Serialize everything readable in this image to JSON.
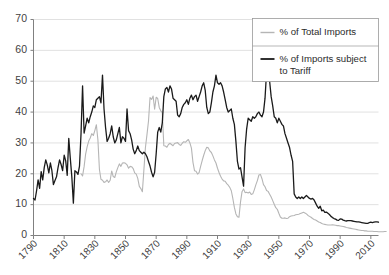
{
  "chart_data": {
    "type": "line",
    "title": "",
    "subtitle": "",
    "xlabel": "",
    "ylabel": "",
    "xlim": [
      1790,
      2015
    ],
    "ylim": [
      0,
      70
    ],
    "yticks": [
      0,
      10,
      20,
      30,
      40,
      50,
      60,
      70
    ],
    "ytick_labels": [
      "0",
      "10",
      "20",
      "30",
      "40",
      "50",
      "60",
      "70"
    ],
    "xticks": [
      1790,
      1810,
      1830,
      1850,
      1870,
      1890,
      1910,
      1930,
      1950,
      1970,
      1990,
      2010
    ],
    "xtick_labels": [
      "1790",
      "1810",
      "1830",
      "1850",
      "1870",
      "1890",
      "1910",
      "1930",
      "1950",
      "1970",
      "1990",
      "2010"
    ],
    "xtick_rotation": 45,
    "grid": "horizontal",
    "grid_color": "#d9d9d9",
    "legend_position": "top-right",
    "legend_border_color": "#999999",
    "axis_color": "#808080",
    "series": [
      {
        "name": "% of Total Imports",
        "color": "#b5b5b5",
        "line_width": 1.1,
        "x_start": 1821,
        "values": [
          20.0,
          19.3,
          22.3,
          26.4,
          28.8,
          30.6,
          31.6,
          33.0,
          32.4,
          34.0,
          35.9,
          31.0,
          21.4,
          18.2,
          17.9,
          17.2,
          17.4,
          18.0,
          17.2,
          17.9,
          20.9,
          19.1,
          18.8,
          20.6,
          22.0,
          23.2,
          22.4,
          23.5,
          23.6,
          23.4,
          22.9,
          21.8,
          22.4,
          22.3,
          21.7,
          20.3,
          19.9,
          18.5,
          15.9,
          15.2,
          14.2,
          21.3,
          28.5,
          32.7,
          37.1,
          44.7,
          44.1,
          45.2,
          40.9,
          44.8,
          44.4,
          41.5,
          40.4,
          39.8,
          29.1,
          29.0,
          28.6,
          29.5,
          29.9,
          29.5,
          29.1,
          29.8,
          30.0,
          30.1,
          29.5,
          29.2,
          29.9,
          30.4,
          30.2,
          30.7,
          31.1,
          30.0,
          28.3,
          23.7,
          21.0,
          20.8,
          19.9,
          20.4,
          22.4,
          24.3,
          26.0,
          27.5,
          28.6,
          28.4,
          27.4,
          26.9,
          25.8,
          24.5,
          23.5,
          21.8,
          20.4,
          19.2,
          18.3,
          17.7,
          17.6,
          16.8,
          16.3,
          15.6,
          14.5,
          12.0,
          9.1,
          7.0,
          6.1,
          5.9,
          10.8,
          14.2,
          15.1,
          13.9,
          14.0,
          13.8,
          14.1,
          13.3,
          13.5,
          14.8,
          16.4,
          17.8,
          19.6,
          19.8,
          18.4,
          16.5,
          15.8,
          14.6,
          14.3,
          13.4,
          12.5,
          11.3,
          10.1,
          9.0,
          8.5,
          7.2,
          6.0,
          5.6,
          5.6,
          5.7,
          5.5,
          5.6,
          6.1,
          6.3,
          6.4,
          6.5,
          6.7,
          6.8,
          6.9,
          7.1,
          7.3,
          7.5,
          7.3,
          7.0,
          6.5,
          6.2,
          5.9,
          5.5,
          5.2,
          5.0,
          4.7,
          4.4,
          4.2,
          3.9,
          3.7,
          3.6,
          3.5,
          3.4,
          3.4,
          3.4,
          3.5,
          3.4,
          3.3,
          3.2,
          3.2,
          3.1,
          3.0,
          2.9,
          2.8,
          2.6,
          2.5,
          2.4,
          2.3,
          2.2,
          2.1,
          2.0,
          1.9,
          1.8,
          1.7,
          1.6,
          1.6,
          1.5,
          1.5,
          1.4,
          1.4,
          1.4,
          1.4,
          1.3,
          1.3,
          1.3,
          1.2,
          1.2,
          1.2,
          1.2,
          1.3,
          1.3
        ]
      },
      {
        "name": "% of Imports subject to Tariff",
        "color": "#1a1a1a",
        "line_width": 1.3,
        "x_start": 1790,
        "values": [
          12.0,
          11.5,
          14.5,
          18.0,
          15.3,
          20.7,
          18.0,
          22.0,
          24.5,
          22.8,
          20.3,
          23.5,
          21.0,
          16.5,
          17.8,
          19.0,
          22.0,
          24.5,
          23.0,
          21.0,
          26.0,
          24.2,
          19.5,
          31.5,
          25.0,
          19.0,
          10.5,
          21.0,
          20.6,
          19.8,
          22.5,
          33.0,
          48.5,
          33.2,
          35.5,
          38.0,
          36.5,
          38.5,
          40.0,
          42.0,
          41.5,
          44.0,
          44.5,
          45.0,
          43.0,
          52.0,
          41.0,
          35.0,
          30.5,
          31.5,
          33.0,
          35.5,
          32.0,
          30.0,
          31.0,
          33.0,
          35.0,
          30.0,
          32.0,
          31.5,
          30.5,
          41.0,
          34.0,
          33.0,
          31.0,
          28.0,
          26.5,
          27.5,
          29.0,
          27.5,
          27.0,
          26.5,
          27.0,
          26.5,
          25.5,
          24.0,
          22.5,
          20.5,
          19.0,
          20.5,
          26.5,
          33.5,
          35.0,
          33.5,
          36.5,
          45.0,
          47.5,
          48.0,
          46.5,
          48.5,
          47.5,
          44.5,
          44.0,
          43.5,
          39.0,
          38.5,
          39.5,
          41.5,
          42.5,
          43.0,
          44.0,
          42.5,
          44.5,
          45.5,
          44.0,
          45.0,
          45.5,
          43.5,
          45.0,
          46.5,
          48.5,
          49.5,
          47.0,
          41.5,
          39.5,
          40.0,
          43.0,
          46.5,
          48.5,
          52.0,
          49.5,
          49.0,
          49.5,
          48.5,
          46.5,
          44.0,
          41.5,
          40.0,
          40.5,
          41.0,
          38.0,
          36.0,
          30.5,
          24.0,
          21.5,
          22.0,
          19.0,
          16.0,
          28.5,
          34.5,
          38.0,
          37.5,
          37.0,
          38.5,
          38.0,
          38.5,
          39.5,
          40.0,
          39.0,
          38.5,
          40.0,
          44.5,
          53.0,
          59.0,
          50.0,
          45.0,
          42.0,
          38.5,
          38.0,
          36.5,
          38.0,
          37.0,
          36.0,
          35.5,
          33.0,
          31.5,
          30.0,
          28.5,
          26.0,
          24.0,
          13.5,
          12.5,
          12.0,
          12.5,
          12.0,
          12.5,
          12.0,
          12.5,
          13.0,
          12.5,
          12.0,
          11.8,
          12.0,
          11.5,
          10.5,
          9.5,
          8.8,
          9.5,
          8.0,
          8.2,
          7.5,
          7.6,
          7.2,
          6.8,
          6.2,
          5.8,
          5.5,
          5.3,
          5.0,
          4.9,
          5.4,
          5.3,
          5.0,
          4.8,
          4.7,
          4.8,
          4.8,
          4.8,
          4.7,
          4.6,
          4.5,
          4.4,
          4.4,
          4.3,
          4.2,
          4.1,
          4.0,
          3.9,
          3.9,
          4.2,
          4.3,
          4.2,
          4.3,
          4.4,
          4.4,
          4.3
        ]
      }
    ]
  },
  "legend": {
    "items": [
      {
        "label": "% of Total Imports",
        "color": "#b5b5b5"
      },
      {
        "label": "% of Imports subject to Tariff",
        "label_line1": "% of Imports subject",
        "label_line2": "to Tariff",
        "color": "#1a1a1a"
      }
    ]
  }
}
